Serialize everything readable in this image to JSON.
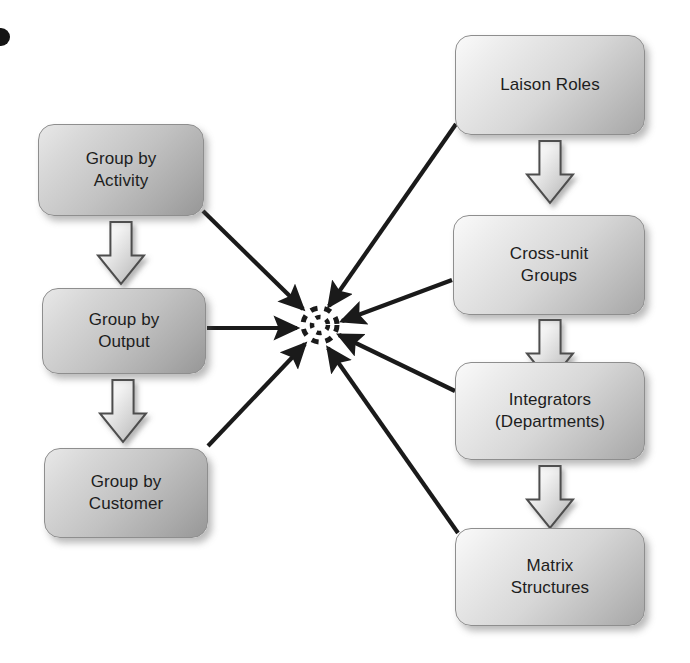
{
  "diagram": {
    "background_color": "#ffffff",
    "line_color": "#1a1a1a",
    "box_border_color": "#8e8e8e",
    "text_color": "#1d1d1d",
    "hub": {
      "name": "integration-hub",
      "shape": "dashed-circle",
      "cx": 320,
      "cy": 325,
      "r": 17
    },
    "left_column": {
      "title": "Grouping mechanisms",
      "nodes": [
        {
          "id": "group-by-activity",
          "label": "Group by\nActivity",
          "x": 38,
          "y": 124,
          "w": 166,
          "h": 92,
          "tone": "dark"
        },
        {
          "id": "group-by-output",
          "label": "Group by\nOutput",
          "x": 42,
          "y": 288,
          "w": 164,
          "h": 86,
          "tone": "dark"
        },
        {
          "id": "group-by-customer",
          "label": "Group by\nCustomer",
          "x": 44,
          "y": 448,
          "w": 164,
          "h": 90,
          "tone": "dark"
        }
      ],
      "flow_arrows": [
        {
          "id": "arrow-activity-to-output",
          "x": 98,
          "y": 222,
          "w": 46,
          "h": 62
        },
        {
          "id": "arrow-output-to-customer",
          "x": 100,
          "y": 380,
          "w": 46,
          "h": 62
        }
      ]
    },
    "right_column": {
      "title": "Lateral linkage devices",
      "nodes": [
        {
          "id": "laison-roles",
          "label": "Laison Roles",
          "x": 455,
          "y": 35,
          "w": 190,
          "h": 100,
          "tone": "light"
        },
        {
          "id": "cross-unit-groups",
          "label": "Cross-unit\nGroups",
          "x": 453,
          "y": 215,
          "w": 192,
          "h": 100,
          "tone": "light"
        },
        {
          "id": "integrators-departments",
          "label": "Integrators\n(Departments)",
          "x": 455,
          "y": 362,
          "w": 190,
          "h": 98,
          "tone": "light"
        },
        {
          "id": "matrix-structures",
          "label": "Matrix\nStructures",
          "x": 455,
          "y": 528,
          "w": 190,
          "h": 98,
          "tone": "light"
        }
      ],
      "flow_arrows": [
        {
          "id": "arrow-laison-to-crossunit",
          "x": 527,
          "y": 141,
          "w": 46,
          "h": 62
        },
        {
          "id": "arrow-crossunit-to-integrators",
          "x": 527,
          "y": 320,
          "w": 46,
          "h": 62
        },
        {
          "id": "arrow-integrators-to-matrix",
          "x": 527,
          "y": 466,
          "w": 46,
          "h": 62
        }
      ]
    },
    "converging_edges": [
      {
        "id": "edge-group-by-activity-to-hub",
        "from": "group-by-activity",
        "x1": 203,
        "y1": 211,
        "x2": 303,
        "y2": 309
      },
      {
        "id": "edge-group-by-output-to-hub",
        "from": "group-by-output",
        "x1": 207,
        "y1": 328,
        "x2": 297,
        "y2": 328
      },
      {
        "id": "edge-group-by-customer-to-hub",
        "from": "group-by-customer",
        "x1": 208,
        "y1": 446,
        "x2": 305,
        "y2": 344
      },
      {
        "id": "edge-laison-roles-to-hub",
        "from": "laison-roles",
        "x1": 456,
        "y1": 124,
        "x2": 329,
        "y2": 306
      },
      {
        "id": "edge-cross-unit-groups-to-hub",
        "from": "cross-unit-groups",
        "x1": 452,
        "y1": 280,
        "x2": 342,
        "y2": 321
      },
      {
        "id": "edge-integrators-to-hub",
        "from": "integrators-departments",
        "x1": 455,
        "y1": 391,
        "x2": 339,
        "y2": 335
      },
      {
        "id": "edge-matrix-structures-to-hub",
        "from": "matrix-structures",
        "x1": 458,
        "y1": 533,
        "x2": 328,
        "y2": 348
      }
    ],
    "corner_mark": {
      "id": "page-corner-dot",
      "x": -8,
      "y": 28,
      "size": 18
    }
  }
}
